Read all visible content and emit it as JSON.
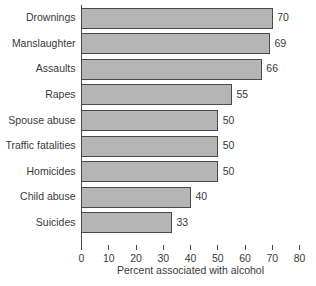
{
  "chart_data": {
    "type": "bar",
    "orientation": "horizontal",
    "title": "",
    "xlabel": "Percent associated with alcohol",
    "ylabel": "",
    "categories": [
      "Drownings",
      "Manslaughter",
      "Assaults",
      "Rapes",
      "Spouse abuse",
      "Traffic fatalities",
      "Homicides",
      "Child abuse",
      "Suicides"
    ],
    "values": [
      70,
      69,
      66,
      55,
      50,
      50,
      50,
      40,
      33
    ],
    "value_labels": [
      "70",
      "69",
      "66",
      "55",
      "50",
      "50",
      "50",
      "40",
      "33"
    ],
    "xlim": [
      0,
      80
    ],
    "xticks": [
      0,
      10,
      20,
      30,
      40,
      50,
      60,
      70,
      80
    ],
    "xtick_labels": [
      "0",
      "10",
      "20",
      "30",
      "40",
      "50",
      "60",
      "70",
      "80"
    ],
    "grid": false,
    "legend": null,
    "bar_fill_color": "#b5b5b5",
    "bar_stroke_color": "#4a4a4a",
    "axis_color": "#4a4a4a",
    "text_color": "#3a3a3a",
    "background_color": "#ffffff"
  }
}
